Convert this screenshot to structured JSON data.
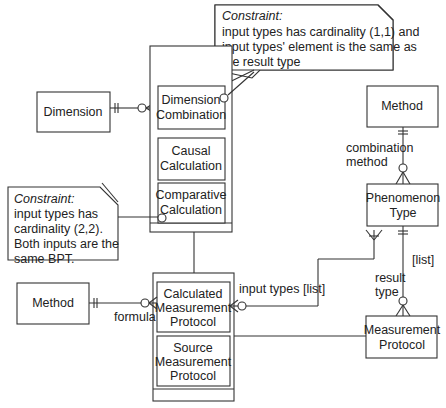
{
  "entities": {
    "dimension": "Dimension",
    "method_left": "Method",
    "method_right": "Method",
    "phenomenon_type": [
      "Phenomenon",
      "Type"
    ],
    "measurement_protocol": [
      "Measurement",
      "Protocol"
    ]
  },
  "supertype_calculation": {
    "subtypes": [
      [
        "Dimension",
        "Combination"
      ],
      [
        "Causal",
        "Calculation"
      ],
      [
        "Comparative",
        "Calculation"
      ]
    ]
  },
  "supertype_protocol": {
    "subtypes": [
      [
        "Calculated",
        "Measurement",
        "Protocol"
      ],
      [
        "Source",
        "Measurement",
        "Protocol"
      ]
    ]
  },
  "notes": {
    "top": {
      "title": "Constraint:",
      "lines": [
        "input types has cardinality (1,1) and",
        "input types' element is the same as",
        "the result type"
      ]
    },
    "left": {
      "title": "Constraint:",
      "lines": [
        "input types has",
        "cardinality (2,2).",
        "Both inputs are the",
        "same BPT."
      ]
    }
  },
  "relationship_labels": {
    "combination_method": [
      "combination",
      "method"
    ],
    "formula": "formula",
    "input_types": "input types [list]",
    "list": "[list]",
    "result_type": [
      "result",
      "type"
    ]
  }
}
